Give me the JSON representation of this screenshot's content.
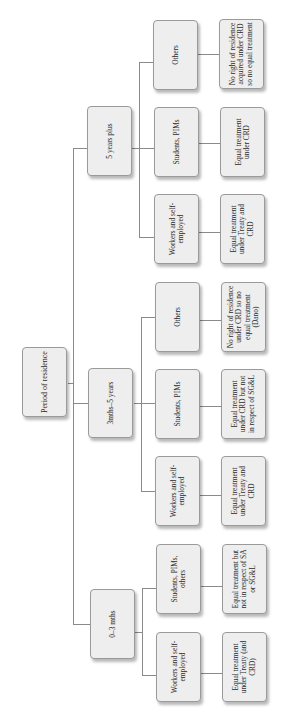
{
  "diagram": {
    "root": {
      "label": "Period of residence"
    },
    "branches": [
      {
        "label": "5 years plus",
        "children": [
          {
            "label": "Others",
            "outcome": "No right of residence acquired under CRD so no equal treatment"
          },
          {
            "label": "Students, PIMs",
            "outcome": "Equal treatment under CRD"
          },
          {
            "label": "Workers and self-employed",
            "outcome": "Equal treatment under Treaty and CRD"
          }
        ]
      },
      {
        "label": "3mths–5 years",
        "children": [
          {
            "label": "Others",
            "outcome": "No right of residence under CRD so no equal treatment (Dano)"
          },
          {
            "label": "Students, PIMs",
            "outcome": "Equal treatment under CRD but not in respect of SG&L"
          },
          {
            "label": "Workers and self-employed",
            "outcome": "Equal treatment under Treaty and CRD"
          }
        ]
      },
      {
        "label": "0–3 mths",
        "children": [
          {
            "label": "Students, PIMs, others",
            "outcome": "Equal treatment but not in respect of SA or SG&L"
          },
          {
            "label": "Workers and self-employed",
            "outcome": "Equal treatment under Treaty (and CRD)"
          }
        ]
      }
    ]
  }
}
